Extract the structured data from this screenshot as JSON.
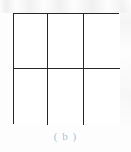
{
  "figure": {
    "caption": "( b )",
    "caption_color": "#aebfd0",
    "line_color": "#262626",
    "background_color": "#ffffff",
    "columns": 3,
    "rows": 2,
    "cells": [
      {
        "id": "r1c1",
        "label": ""
      },
      {
        "id": "r1c2",
        "label": ""
      },
      {
        "id": "r1c3",
        "label": ""
      },
      {
        "id": "r2c1",
        "label": ""
      },
      {
        "id": "r2c2",
        "label": ""
      },
      {
        "id": "r2c3",
        "label": ""
      }
    ]
  },
  "chart_data": {
    "type": "diagram",
    "title": "( b )",
    "columns": 3,
    "rows": 2,
    "total_cells": 6
  }
}
